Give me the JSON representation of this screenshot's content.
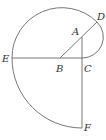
{
  "diagram": {
    "labels": {
      "A": "A",
      "B": "B",
      "C": "C",
      "D": "D",
      "E": "E",
      "F": "F"
    },
    "points": {
      "A": [
        82,
        37
      ],
      "B": [
        60,
        58
      ],
      "C": [
        82,
        58
      ],
      "D": [
        97,
        22
      ],
      "E": [
        12,
        58
      ],
      "F": [
        82,
        128
      ]
    },
    "segments": [
      "E-C",
      "B-D",
      "A-C",
      "C-F"
    ],
    "arcs": [
      "C-D (center A)",
      "D-E (center B)",
      "E-F (center C)"
    ],
    "colors": {
      "stroke": "#777777",
      "label": "#333333",
      "background": "#ffffff"
    }
  }
}
